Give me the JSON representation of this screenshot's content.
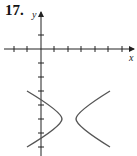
{
  "problem": {
    "number": "17."
  },
  "graph": {
    "x_axis_label": "x",
    "y_axis_label": "y",
    "curve": "hyperbola (horizontal transverse axis)",
    "colors": {
      "axes": "#222222",
      "curve": "#555555"
    }
  }
}
